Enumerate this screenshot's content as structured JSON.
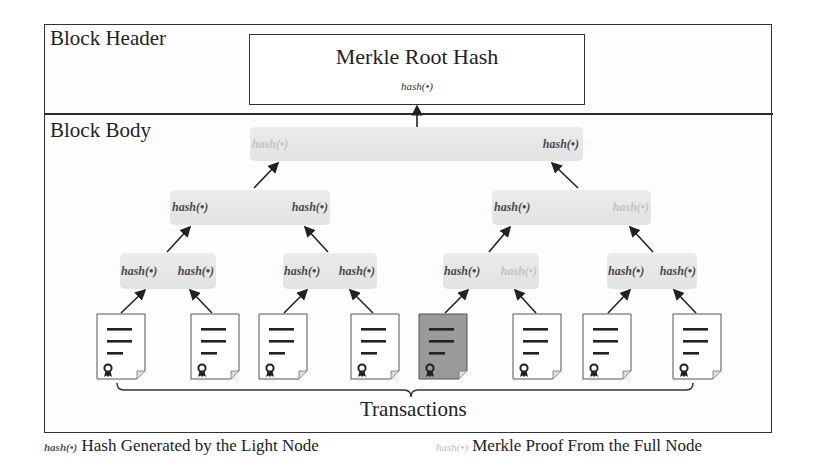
{
  "header": {
    "label": "Block Header",
    "merkle_root": {
      "title": "Merkle Root Hash",
      "fn": "hash(•)"
    }
  },
  "body": {
    "label": "Block Body",
    "tree": {
      "level1": [
        {
          "text": "hash(•)",
          "type": "proof"
        },
        {
          "text": "hash(•)",
          "type": "light"
        }
      ],
      "level2": [
        {
          "text": "hash(•)",
          "type": "light"
        },
        {
          "text": "hash(•)",
          "type": "light"
        },
        {
          "text": "hash(•)",
          "type": "light"
        },
        {
          "text": "hash(•)",
          "type": "proof"
        }
      ],
      "level3": [
        {
          "text": "hash(•)",
          "type": "light"
        },
        {
          "text": "hash(•)",
          "type": "light"
        },
        {
          "text": "hash(•)",
          "type": "light"
        },
        {
          "text": "hash(•)",
          "type": "light"
        },
        {
          "text": "hash(•)",
          "type": "light"
        },
        {
          "text": "hash(•)",
          "type": "proof"
        },
        {
          "text": "hash(•)",
          "type": "light"
        },
        {
          "text": "hash(•)",
          "type": "light"
        }
      ]
    },
    "transactions": {
      "label": "Transactions",
      "count": 8,
      "highlighted_index": 4
    }
  },
  "legend": [
    {
      "symbol": "hash(•)",
      "type": "light",
      "text": "Hash Generated by the Light Node"
    },
    {
      "symbol": "hash(•)",
      "type": "proof",
      "text": "Merkle Proof From the Full Node"
    }
  ],
  "colors": {
    "light_hash": "#4a4a4a",
    "proof_hash": "#c4c4c4",
    "node_bg": "#e6e6e6",
    "highlighted_tx": "#9a9a9a"
  }
}
